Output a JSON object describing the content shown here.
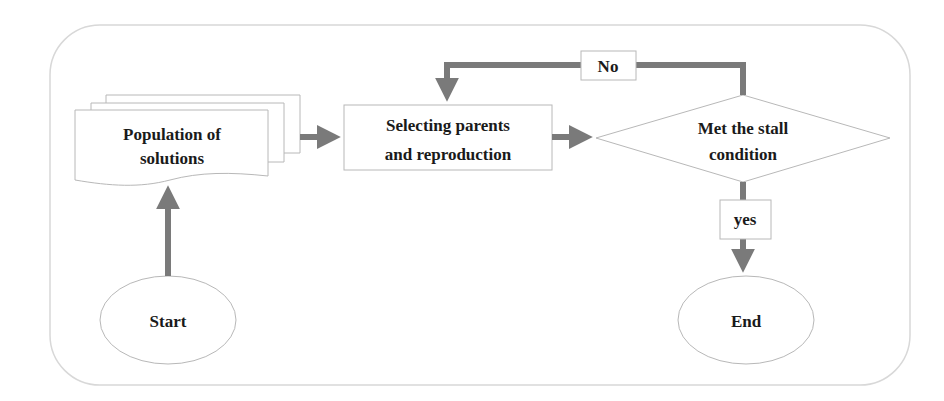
{
  "diagram": {
    "type": "flowchart",
    "colors": {
      "arrow": "#7a7a7a",
      "shape_stroke": "#b0b0b0",
      "frame_stroke": "#d8d8d8",
      "text": "#1a1a1a"
    },
    "nodes": {
      "population": {
        "label_line1": "Population of",
        "label_line2": "solutions",
        "shape": "multi-document"
      },
      "selecting": {
        "label_line1": "Selecting parents",
        "label_line2": "and reproduction",
        "shape": "rectangle"
      },
      "condition": {
        "label_line1": "Met the stall",
        "label_line2": "condition",
        "shape": "diamond"
      },
      "start": {
        "label": "Start",
        "shape": "ellipse"
      },
      "end": {
        "label": "End",
        "shape": "ellipse"
      }
    },
    "edge_labels": {
      "no": "No",
      "yes": "yes"
    },
    "edges": [
      {
        "from": "start",
        "to": "population"
      },
      {
        "from": "population",
        "to": "selecting"
      },
      {
        "from": "selecting",
        "to": "condition"
      },
      {
        "from": "condition",
        "to": "selecting",
        "label": "No"
      },
      {
        "from": "condition",
        "to": "end",
        "label": "yes"
      }
    ]
  }
}
